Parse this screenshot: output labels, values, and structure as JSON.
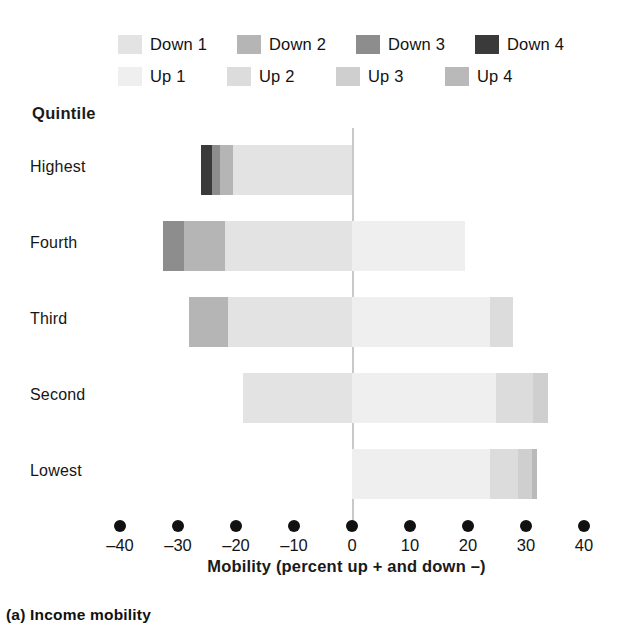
{
  "caption": "(a) Income mobility",
  "axis_title": "Mobility (percent up + and down –)",
  "quintile_header": "Quintile",
  "legend": {
    "down": [
      {
        "label": "Down 1",
        "color": "#e3e3e3"
      },
      {
        "label": "Down 2",
        "color": "#b5b5b5"
      },
      {
        "label": "Down 3",
        "color": "#8d8d8d"
      },
      {
        "label": "Down 4",
        "color": "#3a3a3a"
      }
    ],
    "up": [
      {
        "label": "Up 1",
        "color": "#efefef"
      },
      {
        "label": "Up 2",
        "color": "#dcdcdc"
      },
      {
        "label": "Up 3",
        "color": "#cfcfcf"
      },
      {
        "label": "Up 4",
        "color": "#b9b9b9"
      }
    ]
  },
  "chart_data": {
    "type": "bar",
    "orientation": "horizontal",
    "stacked": true,
    "title": "(a) Income mobility",
    "xlabel": "Mobility (percent up + and down –)",
    "ylabel": "Quintile",
    "xlim": [
      -45,
      45
    ],
    "xticks": [
      -40,
      -30,
      -20,
      -10,
      0,
      10,
      20,
      30,
      40
    ],
    "xticklabels": [
      "–40",
      "–30",
      "–20",
      "–10",
      "0",
      "10",
      "20",
      "30",
      "40"
    ],
    "grid": false,
    "legend_position": "top",
    "categories": [
      "Highest",
      "Fourth",
      "Third",
      "Second",
      "Lowest"
    ],
    "series": [
      {
        "name": "Down 4",
        "color": "#3a3a3a",
        "values": [
          -1.9,
          0,
          0,
          0,
          0
        ]
      },
      {
        "name": "Down 3",
        "color": "#8d8d8d",
        "values": [
          -1.4,
          -3.6,
          0,
          0,
          0
        ]
      },
      {
        "name": "Down 2",
        "color": "#b5b5b5",
        "values": [
          -2.2,
          -7.1,
          -6.7,
          0,
          0
        ]
      },
      {
        "name": "Down 1",
        "color": "#e3e3e3",
        "values": [
          -20.5,
          -21.9,
          -21.4,
          -18.8,
          0
        ]
      },
      {
        "name": "Up 1",
        "color": "#efefef",
        "values": [
          0,
          19.5,
          23.8,
          24.8,
          23.8
        ]
      },
      {
        "name": "Up 2",
        "color": "#dcdcdc",
        "values": [
          0,
          0,
          4.0,
          6.4,
          4.8
        ]
      },
      {
        "name": "Up 3",
        "color": "#cfcfcf",
        "values": [
          0,
          0,
          0,
          2.6,
          2.4
        ]
      },
      {
        "name": "Up 4",
        "color": "#b9b9b9",
        "values": [
          0,
          0,
          0,
          0,
          0.9
        ]
      }
    ],
    "rows": [
      {
        "category": "Highest",
        "down_total": -26.0,
        "up_total": 0.0,
        "segments": [
          {
            "series": "Down 4",
            "value": -1.9
          },
          {
            "series": "Down 3",
            "value": -1.4
          },
          {
            "series": "Down 2",
            "value": -2.2
          },
          {
            "series": "Down 1",
            "value": -20.5
          }
        ]
      },
      {
        "category": "Fourth",
        "down_total": -32.6,
        "up_total": 19.5,
        "segments": [
          {
            "series": "Down 3",
            "value": -3.6
          },
          {
            "series": "Down 2",
            "value": -7.1
          },
          {
            "series": "Down 1",
            "value": -21.9
          },
          {
            "series": "Up 1",
            "value": 19.5
          }
        ]
      },
      {
        "category": "Third",
        "down_total": -28.1,
        "up_total": 27.8,
        "segments": [
          {
            "series": "Down 2",
            "value": -6.7
          },
          {
            "series": "Down 1",
            "value": -21.4
          },
          {
            "series": "Up 1",
            "value": 23.8
          },
          {
            "series": "Up 2",
            "value": 4.0
          }
        ]
      },
      {
        "category": "Second",
        "down_total": -18.8,
        "up_total": 33.8,
        "segments": [
          {
            "series": "Down 1",
            "value": -18.8
          },
          {
            "series": "Up 1",
            "value": 24.8
          },
          {
            "series": "Up 2",
            "value": 6.4
          },
          {
            "series": "Up 3",
            "value": 2.6
          }
        ]
      },
      {
        "category": "Lowest",
        "down_total": 0.0,
        "up_total": 31.9,
        "segments": [
          {
            "series": "Up 1",
            "value": 23.8
          },
          {
            "series": "Up 2",
            "value": 4.8
          },
          {
            "series": "Up 3",
            "value": 2.4
          },
          {
            "series": "Up 4",
            "value": 0.9
          }
        ]
      }
    ]
  }
}
